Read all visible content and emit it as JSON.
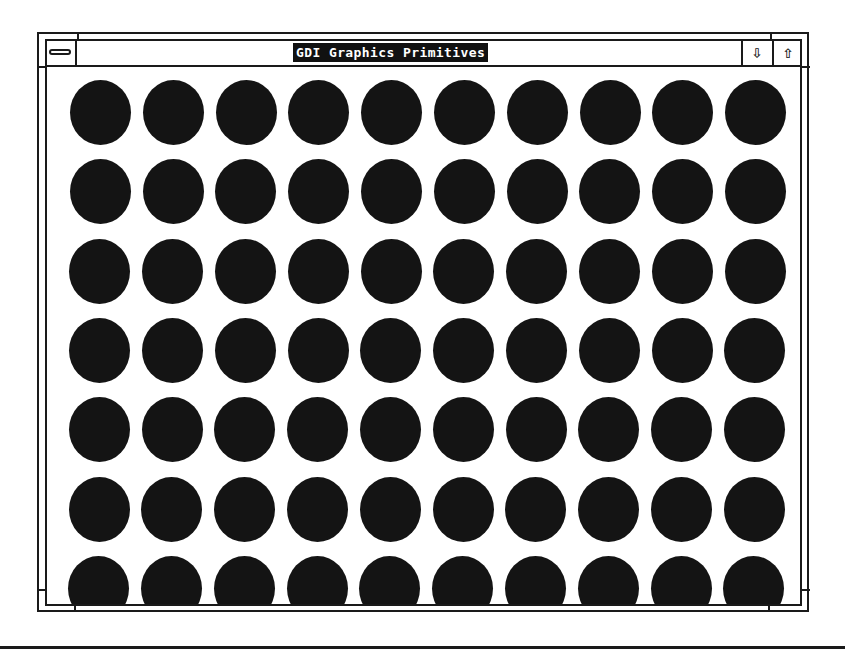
{
  "window": {
    "title": "GDI Graphics Primitives",
    "system_menu_icon": "system-menu-bar-icon",
    "minimize_glyph": "⇩",
    "maximize_glyph": "⇧"
  },
  "client": {
    "shape": "filled-ellipse",
    "fill_color": "#141414",
    "background_color": "#ffffff",
    "grid": {
      "columns": 10,
      "rows": 7,
      "last_row_clipped": true
    }
  }
}
